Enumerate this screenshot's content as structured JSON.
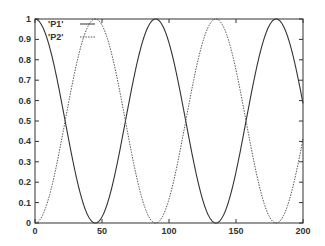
{
  "chart_data": {
    "type": "line",
    "title": "",
    "xlabel": "",
    "ylabel": "",
    "xlim": [
      0,
      200
    ],
    "ylim": [
      0,
      1
    ],
    "grid": false,
    "legend_position": "top-left (inside)",
    "x_ticks": [
      0,
      50,
      100,
      150,
      200
    ],
    "x_tick_labels": [
      "0",
      "50",
      "100",
      "150",
      "200"
    ],
    "y_ticks": [
      0,
      0.1,
      0.2,
      0.3,
      0.4,
      0.5,
      0.6,
      0.7,
      0.8,
      0.9,
      1
    ],
    "y_tick_labels": [
      "0",
      "0.1",
      "0.2",
      "0.3",
      "0.4",
      "0.5",
      "0.6",
      "0.7",
      "0.8",
      "0.9",
      "1"
    ],
    "x": [
      0,
      10,
      20,
      22.5,
      30,
      40,
      45,
      50,
      60,
      67.5,
      70,
      80,
      90,
      100,
      110,
      112.5,
      120,
      130,
      135,
      140,
      150,
      157.5,
      160,
      170,
      180,
      190,
      200
    ],
    "series": [
      {
        "name": "'P1'",
        "style": "solid",
        "values": [
          1.0,
          0.883,
          0.587,
          0.5,
          0.25,
          0.03,
          0.0,
          0.03,
          0.25,
          0.5,
          0.587,
          0.883,
          1.0,
          0.883,
          0.587,
          0.5,
          0.25,
          0.03,
          0.0,
          0.03,
          0.25,
          0.5,
          0.587,
          0.883,
          1.0,
          0.883,
          0.587
        ]
      },
      {
        "name": "'P2'",
        "style": "dotted",
        "values": [
          0.0,
          0.117,
          0.413,
          0.5,
          0.75,
          0.97,
          1.0,
          0.97,
          0.75,
          0.5,
          0.413,
          0.117,
          0.0,
          0.117,
          0.413,
          0.5,
          0.75,
          0.97,
          1.0,
          0.97,
          0.75,
          0.5,
          0.413,
          0.117,
          0.0,
          0.117,
          0.413
        ]
      }
    ],
    "legend": [
      "'P1'",
      "'P2'"
    ]
  },
  "legend": {
    "p1_label": "'P1'",
    "p2_label": "'P2'"
  }
}
